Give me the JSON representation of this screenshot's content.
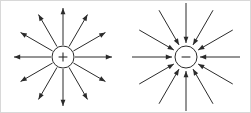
{
  "figure": {
    "background_color": "#ffffff",
    "line_color": "#2b2b2b",
    "border_color": "#d8d8d8",
    "width": 251,
    "height": 113
  },
  "diagrams": [
    {
      "id": "positive-charge",
      "label": "+",
      "sign": "positive",
      "field_direction": "outward",
      "center": {
        "x": 63,
        "y": 57
      },
      "circle_radius": 11,
      "ray_count": 12,
      "ray_angle_step_deg": 30,
      "ray_inner_radius": 12,
      "ray_outer_radius": 49,
      "arrow_at": "outer-end"
    },
    {
      "id": "negative-charge",
      "label": "−",
      "sign": "negative",
      "field_direction": "inward",
      "center": {
        "x": 186,
        "y": 57
      },
      "circle_radius": 11,
      "ray_count": 12,
      "ray_angle_step_deg": 30,
      "ray_inner_radius": 14,
      "ray_outer_radius": 54,
      "arrow_at": "inner-end"
    }
  ]
}
